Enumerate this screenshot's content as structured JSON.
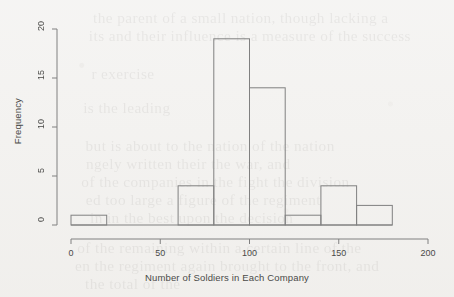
{
  "figure": {
    "type": "histogram",
    "bg_color": "#f2f1ef",
    "ink_color": "#808080"
  },
  "axes": {
    "x_label": "Number of Soldiers in Each Company",
    "y_label": "Frequency",
    "x_ticks": [
      "0",
      "50",
      "100",
      "150",
      "200"
    ],
    "y_ticks": [
      "0",
      "5",
      "10",
      "15",
      "20"
    ]
  },
  "chart_data": {
    "type": "bar",
    "title": "",
    "subtitle": "",
    "xlabel": "Number of Soldiers in Each Company",
    "ylabel": "Frequency",
    "xlim": [
      0,
      200
    ],
    "ylim": [
      0,
      20
    ],
    "x_ticks": [
      0,
      50,
      100,
      150,
      200
    ],
    "y_ticks": [
      0,
      5,
      10,
      15,
      20
    ],
    "grid": false,
    "legend": false,
    "bin_width": 20,
    "bin_edges": [
      0,
      20,
      40,
      60,
      80,
      100,
      120,
      140,
      160,
      180
    ],
    "categories": [
      "0-20",
      "20-40",
      "40-60",
      "60-80",
      "80-100",
      "100-120",
      "120-140",
      "140-160",
      "160-180"
    ],
    "values": [
      1,
      0,
      0,
      4,
      19,
      14,
      1,
      4,
      2
    ],
    "bar_fill": "none",
    "bar_edge_color": "#808080"
  },
  "scan_bleed": {
    "lines": [
      {
        "t": "the parent of a small nation, though lacking a",
        "x": 96,
        "y": 10
      },
      {
        "t": "its and their influence is a measure of the success",
        "x": 92,
        "y": 28
      },
      {
        "t": "r exercise",
        "x": 92,
        "y": 66
      },
      {
        "t": "is the leading",
        "x": 84,
        "y": 100
      },
      {
        "t": "but is about to the nation of the nation",
        "x": 88,
        "y": 138
      },
      {
        "t": "ngely written their the war, and",
        "x": 88,
        "y": 156
      },
      {
        "t": "of the companies in the fight the division",
        "x": 84,
        "y": 174
      },
      {
        "t": "ed too large a figure of the regiment",
        "x": 88,
        "y": 192
      },
      {
        "t": "in in the best upon the decision",
        "x": 92,
        "y": 210
      },
      {
        "t": "of the remaining within a certain line of the",
        "x": 80,
        "y": 240
      },
      {
        "t": "en the regiment again brought to the front, and",
        "x": 78,
        "y": 258
      },
      {
        "t": "the total of the",
        "x": 86,
        "y": 276
      }
    ]
  }
}
